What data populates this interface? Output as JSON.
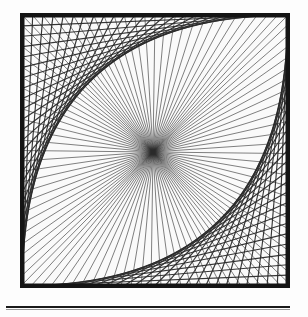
{
  "page": {
    "width": 308,
    "height": 317,
    "background_color": "#fdfdfd",
    "ink_color": "#1a1a1a",
    "kind": "scanned-line-art-figure"
  },
  "figure": {
    "name": "string-art-square",
    "frame": {
      "x": 20,
      "y": 13,
      "width": 270,
      "height": 275,
      "border_width": 4.5,
      "border_color": "#141414",
      "fill_color": "#fafafa"
    },
    "center_point": {
      "x": 153,
      "y": 152
    },
    "divisions": 26,
    "line_color": "#2a2a2a",
    "line_width": 0.7,
    "heavy_line_width": 1.15,
    "envelope_quadrants": [
      "top-left",
      "bottom-right"
    ],
    "open_quadrants": [
      "top-right",
      "bottom-left"
    ]
  },
  "rule": {
    "name": "horizontal-rule",
    "x": 6,
    "y": 306,
    "width": 284,
    "thickness": 2.0,
    "color": "#1a1a1a",
    "hairline_offset": 3.2,
    "hairline_thickness": 0.8
  },
  "chart_data": {
    "type": "line",
    "title": "",
    "xlabel": "",
    "ylabel": "",
    "grid": false,
    "legend": null,
    "series": [
      {
        "name": "top-left-envelope",
        "description": "Chords from top edge points to left edge points, index i to index (n-i)",
        "point_count": 26
      },
      {
        "name": "bottom-right-envelope",
        "description": "Chords from bottom edge points to right edge points, index i to index (n-i)",
        "point_count": 26
      },
      {
        "name": "radial-chords",
        "description": "Long chords from top/left edge points through the center to opposite bottom/right edge points",
        "point_count": 52
      }
    ]
  }
}
